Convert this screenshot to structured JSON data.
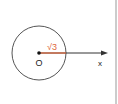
{
  "diagram": {
    "origin_label": "O",
    "axis_label": "x",
    "radius_label": "√3",
    "colors": {
      "circle": "#555555",
      "axis": "#333333",
      "radius": "#e0663a",
      "divider": "#bbbbbb"
    }
  }
}
